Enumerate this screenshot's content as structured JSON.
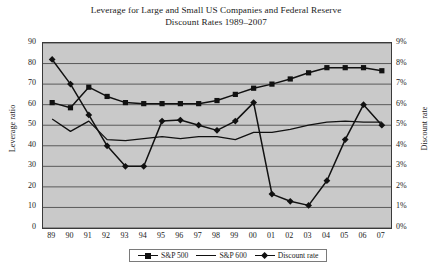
{
  "chart_data": {
    "type": "line",
    "title": "Leverage for Large and Small US Companies and Federal Reserve Discount Rates 1989–2007",
    "title_lines": [
      "Leverage for Large and Small US Companies and Federal Reserve",
      "Discount Rates 1989–2007"
    ],
    "xlabel": "",
    "ylabel": "Leverage ratio",
    "y2label": "Discount rate",
    "grid": true,
    "legend_position": "bottom-center",
    "plot_background": "#c9c9c9",
    "line_color": "#111111",
    "categories": [
      "89",
      "90",
      "91",
      "92",
      "93",
      "94",
      "95",
      "96",
      "97",
      "98",
      "99",
      "00",
      "01",
      "02",
      "03",
      "04",
      "05",
      "06",
      "07"
    ],
    "ylim": [
      0,
      90
    ],
    "yticks": [
      "0",
      "10",
      "20",
      "30",
      "40",
      "50",
      "60",
      "70",
      "80",
      "90"
    ],
    "y2lim": [
      0,
      9
    ],
    "y2ticks": [
      "0%",
      "1%",
      "2%",
      "3%",
      "4%",
      "5%",
      "6%",
      "7%",
      "8%",
      "9%"
    ],
    "series": [
      {
        "name": "S&P 500",
        "axis": "left",
        "marker": "square",
        "values": [
          61,
          58.5,
          68.5,
          64,
          61,
          60.5,
          60.5,
          60.5,
          60.5,
          62,
          65,
          68,
          70,
          72.5,
          75.5,
          78,
          78,
          78,
          76.5
        ]
      },
      {
        "name": "S&P 600",
        "axis": "left",
        "marker": "none",
        "values": [
          53,
          47,
          52,
          43,
          42.5,
          43.5,
          44.5,
          43.5,
          44.5,
          44.5,
          43,
          46.5,
          46.5,
          48,
          50,
          51.5,
          52,
          51.5,
          51.5
        ]
      },
      {
        "name": "Discount rate",
        "axis": "right",
        "marker": "diamond",
        "values": [
          8.2,
          7.0,
          5.5,
          4.0,
          3.0,
          3.0,
          5.2,
          5.25,
          5.0,
          4.75,
          5.2,
          6.1,
          1.65,
          1.3,
          1.1,
          2.3,
          4.3,
          6.0,
          5.0
        ]
      }
    ],
    "legend": [
      {
        "label": "S&P 500",
        "marker": "square"
      },
      {
        "label": "S&P 600",
        "marker": "line"
      },
      {
        "label": "Discount rate",
        "marker": "diamond"
      }
    ]
  }
}
